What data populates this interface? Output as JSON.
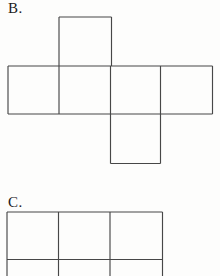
{
  "page": {
    "background": "#fdfdfc",
    "line_color": "#474747",
    "text_color": "#1b1b1b",
    "line_width": 1.15
  },
  "figures": [
    {
      "label": "B.",
      "name": "cube-net-b",
      "shape": "cube-net-row4-top-col2-bottom-col3",
      "lines": [
        [
          59,
          17,
          111.5,
          17
        ],
        [
          59,
          17,
          59,
          114
        ],
        [
          111.5,
          17,
          111.5,
          66
        ],
        [
          8,
          66,
          212.5,
          66
        ],
        [
          8,
          66,
          8,
          114
        ],
        [
          212.5,
          66,
          212.5,
          114
        ],
        [
          8,
          114,
          212.5,
          114
        ],
        [
          110.5,
          66,
          110.5,
          163.5
        ],
        [
          160.5,
          66,
          160.5,
          163.5
        ],
        [
          110.5,
          163.5,
          160.5,
          163.5
        ]
      ]
    },
    {
      "label": "C.",
      "name": "cube-net-c",
      "shape": "grid-3-wide-clipped-at-bottom",
      "lines": [
        [
          7,
          212,
          162.5,
          212
        ],
        [
          7,
          259.5,
          162.5,
          259.5
        ],
        [
          7,
          212,
          7,
          276
        ],
        [
          58.5,
          212,
          58.5,
          276
        ],
        [
          110,
          212,
          110,
          276
        ],
        [
          162.5,
          212,
          162.5,
          276
        ]
      ]
    }
  ]
}
